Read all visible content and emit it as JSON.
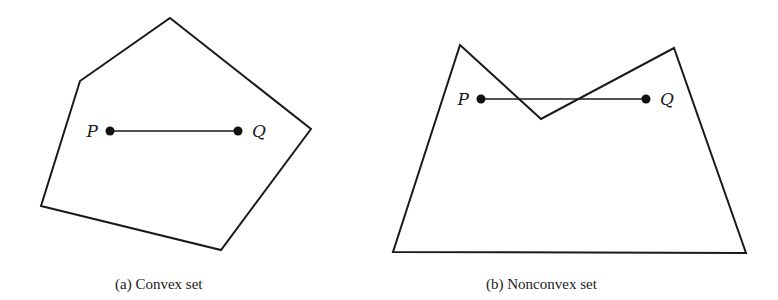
{
  "figure": {
    "panels": [
      {
        "id": "a",
        "caption": "(a) Convex set",
        "shape_vertices": [
          [
            170,
            18
          ],
          [
            311,
            129
          ],
          [
            221,
            250
          ],
          [
            41,
            206
          ],
          [
            80,
            81
          ]
        ],
        "points": [
          {
            "label": "P",
            "x": 110,
            "y": 131
          },
          {
            "label": "Q",
            "x": 238,
            "y": 131
          }
        ]
      },
      {
        "id": "b",
        "caption": "(b) Nonconvex set",
        "shape_vertices": [
          [
            460,
            45
          ],
          [
            541,
            119
          ],
          [
            674,
            48
          ],
          [
            746,
            253
          ],
          [
            393,
            252
          ]
        ],
        "points": [
          {
            "label": "P",
            "x": 481,
            "y": 99
          },
          {
            "label": "Q",
            "x": 646,
            "y": 99
          }
        ]
      }
    ],
    "colors": {
      "stroke": "#1a1a1a",
      "background": "#ffffff"
    }
  }
}
